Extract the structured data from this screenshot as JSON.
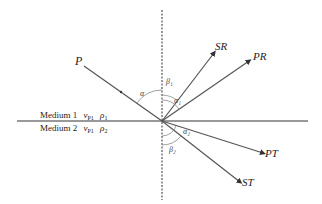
{
  "diagram": {
    "type": "wave reflection and transmission at interface",
    "rays": {
      "incident": "P",
      "reflected_s": "SR",
      "reflected_p": "PR",
      "transmitted_p": "PT",
      "transmitted_s": "ST"
    },
    "angles": {
      "incidence": "α",
      "s_reflection": "β₁",
      "p_reflection": "α₁",
      "p_transmission": "α₂",
      "s_transmission": "β₂"
    },
    "media": {
      "upper": {
        "name": "Medium 1",
        "velocity": "v",
        "velocity_sub": "P1",
        "density": "ρ",
        "density_sub": "1"
      },
      "lower": {
        "name": "Medium 2",
        "velocity": "v",
        "velocity_sub": "P1",
        "density": "ρ",
        "density_sub": "2"
      }
    },
    "colors": {
      "lines": "#555555",
      "text": "#222222",
      "background": "#ffffff"
    }
  }
}
